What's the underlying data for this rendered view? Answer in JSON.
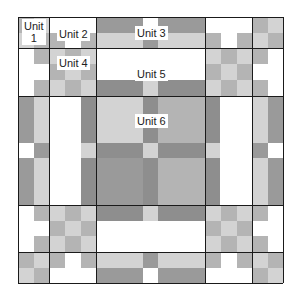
{
  "diagram": {
    "colors": {
      "white": "#ffffff",
      "light": "#d3d3d3",
      "mid": "#b4b4b4",
      "dark": "#9a9a9a",
      "darker": "#8e8e8e",
      "line": "#1a1a1a"
    },
    "grid": {
      "x": [
        18,
        49,
        96,
        205,
        252,
        283
      ],
      "y": [
        17,
        48,
        96,
        205,
        252,
        283
      ]
    },
    "labels": [
      {
        "id": "unit-1",
        "text": "Unit\n1",
        "x": 22,
        "y": 19
      },
      {
        "id": "unit-2",
        "text": "Unit 2",
        "x": 57,
        "y": 27
      },
      {
        "id": "unit-3",
        "text": "Unit 3",
        "x": 135,
        "y": 26
      },
      {
        "id": "unit-4",
        "text": "Unit 4",
        "x": 57,
        "y": 56
      },
      {
        "id": "unit-5",
        "text": "Unit 5",
        "x": 135,
        "y": 67
      },
      {
        "id": "unit-6",
        "text": "Unit 6",
        "x": 135,
        "y": 114
      }
    ],
    "rects": [
      {
        "x": 18,
        "y": 17,
        "w": 16,
        "h": 16,
        "c": "mid"
      },
      {
        "x": 34,
        "y": 17,
        "w": 15,
        "h": 16,
        "c": "light"
      },
      {
        "x": 18,
        "y": 33,
        "w": 16,
        "h": 15,
        "c": "light"
      },
      {
        "x": 34,
        "y": 33,
        "w": 15,
        "h": 15,
        "c": "mid"
      },
      {
        "x": 49,
        "y": 17,
        "w": 47,
        "h": 16,
        "c": "white"
      },
      {
        "x": 49,
        "y": 33,
        "w": 16,
        "h": 15,
        "c": "mid"
      },
      {
        "x": 65,
        "y": 33,
        "w": 16,
        "h": 15,
        "c": "white"
      },
      {
        "x": 81,
        "y": 33,
        "w": 15,
        "h": 15,
        "c": "mid"
      },
      {
        "x": 96,
        "y": 17,
        "w": 47,
        "h": 16,
        "c": "dark"
      },
      {
        "x": 143,
        "y": 17,
        "w": 15,
        "h": 16,
        "c": "white"
      },
      {
        "x": 158,
        "y": 17,
        "w": 47,
        "h": 16,
        "c": "dark"
      },
      {
        "x": 96,
        "y": 33,
        "w": 47,
        "h": 15,
        "c": "light"
      },
      {
        "x": 143,
        "y": 33,
        "w": 15,
        "h": 15,
        "c": "dark"
      },
      {
        "x": 158,
        "y": 33,
        "w": 47,
        "h": 15,
        "c": "light"
      },
      {
        "x": 205,
        "y": 17,
        "w": 47,
        "h": 16,
        "c": "white"
      },
      {
        "x": 205,
        "y": 33,
        "w": 16,
        "h": 15,
        "c": "mid"
      },
      {
        "x": 221,
        "y": 33,
        "w": 16,
        "h": 15,
        "c": "white"
      },
      {
        "x": 237,
        "y": 33,
        "w": 15,
        "h": 15,
        "c": "mid"
      },
      {
        "x": 252,
        "y": 17,
        "w": 16,
        "h": 16,
        "c": "mid"
      },
      {
        "x": 268,
        "y": 17,
        "w": 15,
        "h": 16,
        "c": "light"
      },
      {
        "x": 252,
        "y": 33,
        "w": 16,
        "h": 15,
        "c": "light"
      },
      {
        "x": 268,
        "y": 33,
        "w": 15,
        "h": 15,
        "c": "mid"
      },
      {
        "x": 18,
        "y": 48,
        "w": 16,
        "h": 48,
        "c": "white"
      },
      {
        "x": 34,
        "y": 48,
        "w": 15,
        "h": 16,
        "c": "mid"
      },
      {
        "x": 34,
        "y": 64,
        "w": 15,
        "h": 16,
        "c": "white"
      },
      {
        "x": 34,
        "y": 80,
        "w": 15,
        "h": 16,
        "c": "mid"
      },
      {
        "x": 49,
        "y": 48,
        "w": 16,
        "h": 16,
        "c": "light"
      },
      {
        "x": 65,
        "y": 48,
        "w": 16,
        "h": 16,
        "c": "mid"
      },
      {
        "x": 81,
        "y": 48,
        "w": 15,
        "h": 16,
        "c": "light"
      },
      {
        "x": 49,
        "y": 64,
        "w": 16,
        "h": 16,
        "c": "mid"
      },
      {
        "x": 65,
        "y": 64,
        "w": 16,
        "h": 16,
        "c": "light"
      },
      {
        "x": 81,
        "y": 64,
        "w": 15,
        "h": 16,
        "c": "mid"
      },
      {
        "x": 49,
        "y": 80,
        "w": 16,
        "h": 16,
        "c": "light"
      },
      {
        "x": 65,
        "y": 80,
        "w": 16,
        "h": 16,
        "c": "mid"
      },
      {
        "x": 81,
        "y": 80,
        "w": 15,
        "h": 16,
        "c": "light"
      },
      {
        "x": 96,
        "y": 48,
        "w": 109,
        "h": 32,
        "c": "white"
      },
      {
        "x": 96,
        "y": 80,
        "w": 47,
        "h": 16,
        "c": "darker"
      },
      {
        "x": 143,
        "y": 80,
        "w": 15,
        "h": 16,
        "c": "light"
      },
      {
        "x": 158,
        "y": 80,
        "w": 47,
        "h": 16,
        "c": "darker"
      },
      {
        "x": 205,
        "y": 48,
        "w": 16,
        "h": 16,
        "c": "light"
      },
      {
        "x": 221,
        "y": 48,
        "w": 16,
        "h": 16,
        "c": "mid"
      },
      {
        "x": 237,
        "y": 48,
        "w": 15,
        "h": 16,
        "c": "light"
      },
      {
        "x": 205,
        "y": 64,
        "w": 16,
        "h": 16,
        "c": "mid"
      },
      {
        "x": 221,
        "y": 64,
        "w": 16,
        "h": 16,
        "c": "light"
      },
      {
        "x": 237,
        "y": 64,
        "w": 15,
        "h": 16,
        "c": "mid"
      },
      {
        "x": 205,
        "y": 80,
        "w": 16,
        "h": 16,
        "c": "light"
      },
      {
        "x": 221,
        "y": 80,
        "w": 16,
        "h": 16,
        "c": "mid"
      },
      {
        "x": 237,
        "y": 80,
        "w": 15,
        "h": 16,
        "c": "light"
      },
      {
        "x": 252,
        "y": 48,
        "w": 16,
        "h": 16,
        "c": "mid"
      },
      {
        "x": 252,
        "y": 64,
        "w": 16,
        "h": 16,
        "c": "white"
      },
      {
        "x": 252,
        "y": 80,
        "w": 16,
        "h": 16,
        "c": "mid"
      },
      {
        "x": 268,
        "y": 48,
        "w": 15,
        "h": 48,
        "c": "white"
      },
      {
        "x": 18,
        "y": 96,
        "w": 16,
        "h": 47,
        "c": "dark"
      },
      {
        "x": 34,
        "y": 96,
        "w": 15,
        "h": 47,
        "c": "light"
      },
      {
        "x": 18,
        "y": 143,
        "w": 16,
        "h": 15,
        "c": "white"
      },
      {
        "x": 34,
        "y": 143,
        "w": 15,
        "h": 15,
        "c": "dark"
      },
      {
        "x": 18,
        "y": 158,
        "w": 16,
        "h": 47,
        "c": "dark"
      },
      {
        "x": 34,
        "y": 158,
        "w": 15,
        "h": 47,
        "c": "light"
      },
      {
        "x": 49,
        "y": 96,
        "w": 32,
        "h": 109,
        "c": "white"
      },
      {
        "x": 81,
        "y": 96,
        "w": 15,
        "h": 47,
        "c": "darker"
      },
      {
        "x": 81,
        "y": 143,
        "w": 15,
        "h": 15,
        "c": "light"
      },
      {
        "x": 81,
        "y": 158,
        "w": 15,
        "h": 47,
        "c": "darker"
      },
      {
        "x": 96,
        "y": 96,
        "w": 47,
        "h": 47,
        "c": "light"
      },
      {
        "x": 143,
        "y": 96,
        "w": 15,
        "h": 47,
        "c": "darker"
      },
      {
        "x": 158,
        "y": 96,
        "w": 47,
        "h": 47,
        "c": "mid"
      },
      {
        "x": 96,
        "y": 143,
        "w": 47,
        "h": 15,
        "c": "darker"
      },
      {
        "x": 143,
        "y": 143,
        "w": 15,
        "h": 15,
        "c": "light"
      },
      {
        "x": 158,
        "y": 143,
        "w": 47,
        "h": 15,
        "c": "darker"
      },
      {
        "x": 96,
        "y": 158,
        "w": 47,
        "h": 47,
        "c": "dark"
      },
      {
        "x": 143,
        "y": 158,
        "w": 15,
        "h": 47,
        "c": "darker"
      },
      {
        "x": 158,
        "y": 158,
        "w": 47,
        "h": 47,
        "c": "mid"
      },
      {
        "x": 205,
        "y": 96,
        "w": 15,
        "h": 47,
        "c": "darker"
      },
      {
        "x": 205,
        "y": 143,
        "w": 15,
        "h": 15,
        "c": "light"
      },
      {
        "x": 205,
        "y": 158,
        "w": 15,
        "h": 47,
        "c": "darker"
      },
      {
        "x": 220,
        "y": 96,
        "w": 32,
        "h": 109,
        "c": "white"
      },
      {
        "x": 252,
        "y": 96,
        "w": 16,
        "h": 47,
        "c": "light"
      },
      {
        "x": 268,
        "y": 96,
        "w": 15,
        "h": 47,
        "c": "dark"
      },
      {
        "x": 252,
        "y": 143,
        "w": 16,
        "h": 15,
        "c": "dark"
      },
      {
        "x": 268,
        "y": 143,
        "w": 15,
        "h": 15,
        "c": "white"
      },
      {
        "x": 252,
        "y": 158,
        "w": 16,
        "h": 47,
        "c": "light"
      },
      {
        "x": 268,
        "y": 158,
        "w": 15,
        "h": 47,
        "c": "dark"
      },
      {
        "x": 18,
        "y": 205,
        "w": 16,
        "h": 47,
        "c": "white"
      },
      {
        "x": 34,
        "y": 205,
        "w": 15,
        "h": 16,
        "c": "mid"
      },
      {
        "x": 34,
        "y": 221,
        "w": 15,
        "h": 15,
        "c": "white"
      },
      {
        "x": 34,
        "y": 236,
        "w": 15,
        "h": 16,
        "c": "mid"
      },
      {
        "x": 49,
        "y": 205,
        "w": 16,
        "h": 16,
        "c": "light"
      },
      {
        "x": 65,
        "y": 205,
        "w": 16,
        "h": 16,
        "c": "mid"
      },
      {
        "x": 81,
        "y": 205,
        "w": 15,
        "h": 16,
        "c": "light"
      },
      {
        "x": 49,
        "y": 221,
        "w": 16,
        "h": 15,
        "c": "mid"
      },
      {
        "x": 65,
        "y": 221,
        "w": 16,
        "h": 15,
        "c": "light"
      },
      {
        "x": 81,
        "y": 221,
        "w": 15,
        "h": 15,
        "c": "mid"
      },
      {
        "x": 49,
        "y": 236,
        "w": 16,
        "h": 16,
        "c": "light"
      },
      {
        "x": 65,
        "y": 236,
        "w": 16,
        "h": 16,
        "c": "mid"
      },
      {
        "x": 81,
        "y": 236,
        "w": 15,
        "h": 16,
        "c": "light"
      },
      {
        "x": 96,
        "y": 205,
        "w": 47,
        "h": 16,
        "c": "darker"
      },
      {
        "x": 143,
        "y": 205,
        "w": 15,
        "h": 16,
        "c": "light"
      },
      {
        "x": 158,
        "y": 205,
        "w": 47,
        "h": 16,
        "c": "darker"
      },
      {
        "x": 96,
        "y": 221,
        "w": 109,
        "h": 31,
        "c": "white"
      },
      {
        "x": 205,
        "y": 205,
        "w": 16,
        "h": 16,
        "c": "light"
      },
      {
        "x": 221,
        "y": 205,
        "w": 16,
        "h": 16,
        "c": "mid"
      },
      {
        "x": 237,
        "y": 205,
        "w": 15,
        "h": 16,
        "c": "light"
      },
      {
        "x": 205,
        "y": 221,
        "w": 16,
        "h": 15,
        "c": "mid"
      },
      {
        "x": 221,
        "y": 221,
        "w": 16,
        "h": 15,
        "c": "light"
      },
      {
        "x": 237,
        "y": 221,
        "w": 15,
        "h": 15,
        "c": "mid"
      },
      {
        "x": 205,
        "y": 236,
        "w": 16,
        "h": 16,
        "c": "light"
      },
      {
        "x": 221,
        "y": 236,
        "w": 16,
        "h": 16,
        "c": "mid"
      },
      {
        "x": 237,
        "y": 236,
        "w": 15,
        "h": 16,
        "c": "light"
      },
      {
        "x": 252,
        "y": 205,
        "w": 16,
        "h": 16,
        "c": "mid"
      },
      {
        "x": 252,
        "y": 221,
        "w": 16,
        "h": 15,
        "c": "white"
      },
      {
        "x": 252,
        "y": 236,
        "w": 16,
        "h": 16,
        "c": "mid"
      },
      {
        "x": 268,
        "y": 205,
        "w": 15,
        "h": 47,
        "c": "white"
      },
      {
        "x": 18,
        "y": 252,
        "w": 16,
        "h": 16,
        "c": "mid"
      },
      {
        "x": 34,
        "y": 252,
        "w": 15,
        "h": 16,
        "c": "light"
      },
      {
        "x": 18,
        "y": 268,
        "w": 16,
        "h": 15,
        "c": "light"
      },
      {
        "x": 34,
        "y": 268,
        "w": 15,
        "h": 15,
        "c": "mid"
      },
      {
        "x": 49,
        "y": 252,
        "w": 16,
        "h": 16,
        "c": "mid"
      },
      {
        "x": 65,
        "y": 252,
        "w": 16,
        "h": 16,
        "c": "white"
      },
      {
        "x": 81,
        "y": 252,
        "w": 15,
        "h": 16,
        "c": "mid"
      },
      {
        "x": 49,
        "y": 268,
        "w": 47,
        "h": 15,
        "c": "white"
      },
      {
        "x": 96,
        "y": 252,
        "w": 47,
        "h": 16,
        "c": "light"
      },
      {
        "x": 143,
        "y": 252,
        "w": 15,
        "h": 16,
        "c": "dark"
      },
      {
        "x": 158,
        "y": 252,
        "w": 47,
        "h": 16,
        "c": "light"
      },
      {
        "x": 96,
        "y": 268,
        "w": 47,
        "h": 15,
        "c": "dark"
      },
      {
        "x": 143,
        "y": 268,
        "w": 15,
        "h": 15,
        "c": "white"
      },
      {
        "x": 158,
        "y": 268,
        "w": 47,
        "h": 15,
        "c": "dark"
      },
      {
        "x": 205,
        "y": 252,
        "w": 16,
        "h": 16,
        "c": "mid"
      },
      {
        "x": 221,
        "y": 252,
        "w": 16,
        "h": 16,
        "c": "white"
      },
      {
        "x": 237,
        "y": 252,
        "w": 15,
        "h": 16,
        "c": "mid"
      },
      {
        "x": 205,
        "y": 268,
        "w": 47,
        "h": 15,
        "c": "white"
      },
      {
        "x": 252,
        "y": 252,
        "w": 16,
        "h": 16,
        "c": "light"
      },
      {
        "x": 268,
        "y": 252,
        "w": 15,
        "h": 16,
        "c": "mid"
      },
      {
        "x": 252,
        "y": 268,
        "w": 16,
        "h": 15,
        "c": "mid"
      },
      {
        "x": 268,
        "y": 268,
        "w": 15,
        "h": 15,
        "c": "light"
      }
    ]
  }
}
